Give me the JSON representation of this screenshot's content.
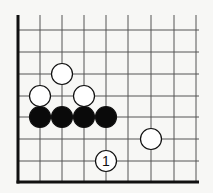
{
  "diagram": {
    "type": "go-board-corner",
    "edges": [
      "left",
      "bottom"
    ],
    "grid": {
      "x_lines": [
        18,
        40,
        62,
        84,
        106,
        128,
        151,
        174,
        196
      ],
      "y_lines": [
        30,
        52,
        74,
        96,
        117,
        139,
        161,
        182
      ],
      "top": 15,
      "right": 199,
      "line_color": "#555555",
      "edge_color": "#111111"
    },
    "stone_radius": 10.5,
    "stones": [
      {
        "color": "white",
        "col": 2,
        "row": 2,
        "label": ""
      },
      {
        "color": "white",
        "col": 1,
        "row": 3,
        "label": ""
      },
      {
        "color": "white",
        "col": 3,
        "row": 3,
        "label": ""
      },
      {
        "color": "black",
        "col": 1,
        "row": 4,
        "label": ""
      },
      {
        "color": "black",
        "col": 2,
        "row": 4,
        "label": ""
      },
      {
        "color": "black",
        "col": 3,
        "row": 4,
        "label": ""
      },
      {
        "color": "black",
        "col": 4,
        "row": 4,
        "label": ""
      },
      {
        "color": "white",
        "col": 6,
        "row": 5,
        "label": ""
      },
      {
        "color": "white",
        "col": 4,
        "row": 6,
        "label": "1"
      }
    ]
  }
}
